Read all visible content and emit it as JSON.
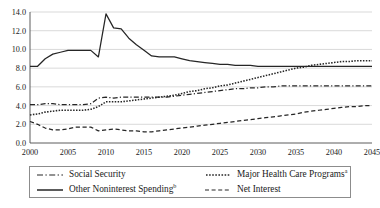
{
  "chart_data": {
    "type": "line",
    "title": "",
    "subtitle": "",
    "xlabel": "",
    "ylabel": "",
    "xlim": [
      2000,
      2045
    ],
    "ylim": [
      0.0,
      14.0
    ],
    "grid": true,
    "legend_position": "bottom",
    "ytick_labels": [
      "0.0",
      "2.0",
      "4.0",
      "6.0",
      "8.0",
      "10.0",
      "12.0",
      "14.0"
    ],
    "ytick_values": [
      0.0,
      2.0,
      4.0,
      6.0,
      8.0,
      10.0,
      12.0,
      14.0
    ],
    "xtick_labels": [
      "2000",
      "2005",
      "2010",
      "2015",
      "2020",
      "2025",
      "2030",
      "2035",
      "2040",
      "2045"
    ],
    "xtick_values": [
      2000,
      2005,
      2010,
      2015,
      2020,
      2025,
      2030,
      2035,
      2040,
      2045
    ],
    "x": [
      2000,
      2001,
      2002,
      2003,
      2004,
      2005,
      2006,
      2007,
      2008,
      2009,
      2010,
      2011,
      2012,
      2013,
      2014,
      2015,
      2016,
      2017,
      2018,
      2019,
      2020,
      2021,
      2022,
      2023,
      2024,
      2025,
      2026,
      2027,
      2028,
      2029,
      2030,
      2031,
      2032,
      2033,
      2034,
      2035,
      2036,
      2037,
      2038,
      2039,
      2040,
      2041,
      2042,
      2043,
      2044,
      2045
    ],
    "series": [
      {
        "name": "Social Security",
        "style": "dashdot",
        "values": [
          4.1,
          4.1,
          4.2,
          4.2,
          4.1,
          4.1,
          4.1,
          4.1,
          4.2,
          4.8,
          4.9,
          4.8,
          4.9,
          4.9,
          4.9,
          4.9,
          4.9,
          4.9,
          4.9,
          5.0,
          5.1,
          5.2,
          5.3,
          5.4,
          5.5,
          5.6,
          5.7,
          5.8,
          5.8,
          5.9,
          5.9,
          6.0,
          6.0,
          6.1,
          6.1,
          6.1,
          6.1,
          6.1,
          6.1,
          6.1,
          6.1,
          6.1,
          6.1,
          6.1,
          6.1,
          6.1
        ]
      },
      {
        "name": "Other Noninterest Spending",
        "style": "solid",
        "values": [
          8.2,
          8.2,
          9.0,
          9.5,
          9.7,
          9.9,
          9.9,
          9.9,
          9.9,
          9.2,
          13.8,
          12.3,
          12.2,
          11.2,
          10.5,
          9.9,
          9.3,
          9.2,
          9.2,
          9.2,
          9.0,
          8.8,
          8.7,
          8.6,
          8.5,
          8.4,
          8.4,
          8.3,
          8.3,
          8.3,
          8.2,
          8.2,
          8.2,
          8.2,
          8.2,
          8.2,
          8.2,
          8.2,
          8.2,
          8.2,
          8.2,
          8.2,
          8.2,
          8.2,
          8.2,
          8.2
        ]
      },
      {
        "name": "Major Health Care Programs",
        "style": "dotted",
        "values": [
          3.0,
          3.1,
          3.3,
          3.4,
          3.5,
          3.5,
          3.5,
          3.5,
          3.6,
          3.9,
          4.4,
          4.4,
          4.4,
          4.5,
          4.6,
          4.7,
          4.8,
          4.9,
          5.0,
          5.1,
          5.3,
          5.5,
          5.6,
          5.8,
          5.9,
          6.1,
          6.2,
          6.4,
          6.6,
          6.8,
          7.0,
          7.2,
          7.4,
          7.6,
          7.8,
          8.0,
          8.1,
          8.3,
          8.4,
          8.5,
          8.6,
          8.7,
          8.7,
          8.8,
          8.8,
          8.8
        ]
      },
      {
        "name": "Net Interest",
        "style": "dashed",
        "values": [
          2.3,
          2.0,
          1.6,
          1.4,
          1.4,
          1.5,
          1.7,
          1.7,
          1.7,
          1.3,
          1.4,
          1.5,
          1.4,
          1.3,
          1.3,
          1.2,
          1.2,
          1.3,
          1.4,
          1.5,
          1.6,
          1.7,
          1.8,
          1.9,
          2.0,
          2.1,
          2.2,
          2.3,
          2.4,
          2.5,
          2.6,
          2.7,
          2.8,
          2.9,
          3.0,
          3.1,
          3.3,
          3.4,
          3.5,
          3.6,
          3.7,
          3.8,
          3.9,
          3.9,
          4.0,
          4.0
        ]
      }
    ]
  },
  "legend": {
    "entries": [
      {
        "label": "Social Security",
        "sup": "",
        "style": "dashdot"
      },
      {
        "label": "Other Noninterest Spending",
        "sup": "b",
        "style": "solid"
      },
      {
        "label": "Major Health Care Programs",
        "sup": "a",
        "style": "dotted"
      },
      {
        "label": "Net Interest",
        "sup": "",
        "style": "dashed"
      }
    ]
  },
  "colors": {
    "line": "#262626",
    "grid": "#c9c9c9",
    "axis": "#4a4a4a",
    "text": "#1a1a1a"
  }
}
